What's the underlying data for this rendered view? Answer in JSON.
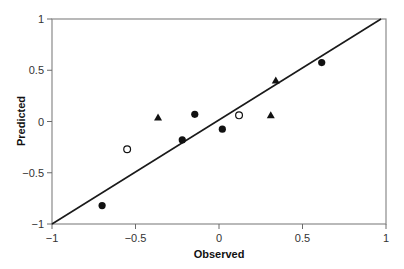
{
  "chart_data": {
    "type": "scatter",
    "title": "",
    "xlabel": "Observed",
    "ylabel": "Predicted",
    "xlim": [
      -1,
      1
    ],
    "ylim": [
      -1,
      1
    ],
    "grid": false,
    "legend": null,
    "x_ticks": [
      -1,
      -0.5,
      0,
      0.5,
      1
    ],
    "x_tick_labels": [
      "−1",
      "−0.5",
      "0",
      "0.5",
      "1"
    ],
    "y_ticks": [
      -1,
      -0.5,
      0,
      0.5,
      1
    ],
    "y_tick_labels": [
      "−1",
      "−0.5",
      "0",
      "0.5",
      "1"
    ],
    "series": [
      {
        "name": "filled-circle",
        "marker": "filled-circle",
        "color": "#111111",
        "points": [
          {
            "x": -0.7,
            "y": -0.82
          },
          {
            "x": -0.22,
            "y": -0.18
          },
          {
            "x": -0.145,
            "y": 0.07
          },
          {
            "x": 0.02,
            "y": -0.075
          },
          {
            "x": 0.615,
            "y": 0.575
          }
        ]
      },
      {
        "name": "open-circle",
        "marker": "open-circle",
        "color": "#111111",
        "points": [
          {
            "x": -0.55,
            "y": -0.27
          },
          {
            "x": 0.12,
            "y": 0.06
          }
        ]
      },
      {
        "name": "triangle",
        "marker": "triangle",
        "color": "#111111",
        "points": [
          {
            "x": -0.365,
            "y": 0.04
          },
          {
            "x": 0.31,
            "y": 0.06
          },
          {
            "x": 0.34,
            "y": 0.4
          }
        ]
      }
    ],
    "fit_line": {
      "x1": -1,
      "y1": -1,
      "x2": 0.97,
      "y2": 1
    }
  }
}
